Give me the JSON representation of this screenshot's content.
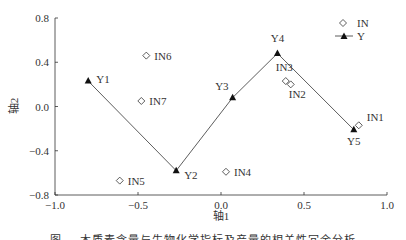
{
  "chart_data": {
    "type": "scatter",
    "title": "",
    "xlabel": "轴1",
    "ylabel": "轴2",
    "xlim": [
      -1.0,
      1.0
    ],
    "ylim": [
      -0.8,
      0.8
    ],
    "xticks": [
      -1.0,
      -0.5,
      0.0,
      0.5,
      1.0
    ],
    "xtick_labels": [
      "−1.0",
      "−0.5",
      "0.0",
      "0.5",
      "1.0"
    ],
    "yticks": [
      0.8,
      0.4,
      0.0,
      -0.4,
      -0.8
    ],
    "ytick_labels": [
      "0.8",
      "0.4",
      "0.0",
      "−0.4",
      "−0.8"
    ],
    "grid": false,
    "legend_position": "upper right",
    "series": [
      {
        "name": "IN",
        "marker": "open-diamond",
        "line": false,
        "points": [
          {
            "label": "IN1",
            "x": 0.83,
            "y": -0.17
          },
          {
            "label": "IN2",
            "x": 0.42,
            "y": 0.2
          },
          {
            "label": "IN3",
            "x": 0.39,
            "y": 0.23
          },
          {
            "label": "IN4",
            "x": 0.03,
            "y": -0.59
          },
          {
            "label": "IN5",
            "x": -0.61,
            "y": -0.67
          },
          {
            "label": "IN6",
            "x": -0.45,
            "y": 0.46
          },
          {
            "label": "IN7",
            "x": -0.48,
            "y": 0.05
          }
        ]
      },
      {
        "name": "Y",
        "marker": "filled-triangle",
        "line": true,
        "points": [
          {
            "label": "Y1",
            "x": -0.8,
            "y": 0.23
          },
          {
            "label": "Y2",
            "x": -0.27,
            "y": -0.58
          },
          {
            "label": "Y3",
            "x": 0.07,
            "y": 0.08
          },
          {
            "label": "Y4",
            "x": 0.34,
            "y": 0.48
          },
          {
            "label": "Y5",
            "x": 0.8,
            "y": -0.21
          }
        ]
      }
    ],
    "legend": [
      {
        "label": "IN",
        "marker": "open-diamond"
      },
      {
        "label": "Y",
        "marker": "line-triangle"
      }
    ]
  },
  "caption": "图 ... 木质素含量与生物化学指标及产量的相关性冗余分析"
}
